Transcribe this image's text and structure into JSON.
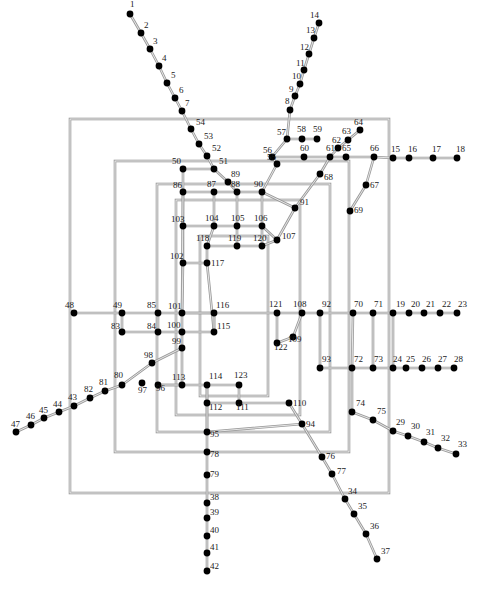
{
  "figure": {
    "type": "graph",
    "width": 478,
    "height": 589,
    "background": "#ffffff",
    "node_color": "#000000",
    "edge_color": "#9a9a9a",
    "label_color": "#1a1a1a",
    "node_count": 123,
    "node_radius": 3.4,
    "edge_width": 2.6
  },
  "nodes": [
    {
      "id": "1",
      "x": 130,
      "y": 14,
      "lx": 130,
      "ly": 7
    },
    {
      "id": "2",
      "x": 141,
      "y": 33,
      "lx": 144,
      "ly": 28
    },
    {
      "id": "3",
      "x": 150,
      "y": 49,
      "lx": 153,
      "ly": 44
    },
    {
      "id": "4",
      "x": 159,
      "y": 66,
      "lx": 162,
      "ly": 61
    },
    {
      "id": "5",
      "x": 167,
      "y": 83,
      "lx": 171,
      "ly": 78
    },
    {
      "id": "6",
      "x": 175,
      "y": 98,
      "lx": 179,
      "ly": 93
    },
    {
      "id": "7",
      "x": 182,
      "y": 111,
      "lx": 185,
      "ly": 106
    },
    {
      "id": "8",
      "x": 290,
      "y": 110,
      "lx": 285,
      "ly": 104
    },
    {
      "id": "9",
      "x": 295,
      "y": 96,
      "lx": 289,
      "ly": 92
    },
    {
      "id": "10",
      "x": 300,
      "y": 84,
      "lx": 292,
      "ly": 79
    },
    {
      "id": "11",
      "x": 304,
      "y": 70,
      "lx": 296,
      "ly": 66
    },
    {
      "id": "12",
      "x": 309,
      "y": 54,
      "lx": 300,
      "ly": 50
    },
    {
      "id": "13",
      "x": 314,
      "y": 38,
      "lx": 306,
      "ly": 33
    },
    {
      "id": "14",
      "x": 319,
      "y": 23,
      "lx": 310,
      "ly": 18
    },
    {
      "id": "15",
      "x": 393,
      "y": 158,
      "lx": 391,
      "ly": 152
    },
    {
      "id": "16",
      "x": 409,
      "y": 158,
      "lx": 408,
      "ly": 152
    },
    {
      "id": "17",
      "x": 433,
      "y": 158,
      "lx": 432,
      "ly": 152
    },
    {
      "id": "18",
      "x": 457,
      "y": 158,
      "lx": 456,
      "ly": 152
    },
    {
      "id": "19",
      "x": 393,
      "y": 313,
      "lx": 396,
      "ly": 307
    },
    {
      "id": "20",
      "x": 409,
      "y": 313,
      "lx": 411,
      "ly": 307
    },
    {
      "id": "21",
      "x": 424,
      "y": 313,
      "lx": 426,
      "ly": 307
    },
    {
      "id": "22",
      "x": 440,
      "y": 313,
      "lx": 442,
      "ly": 307
    },
    {
      "id": "23",
      "x": 457,
      "y": 313,
      "lx": 458,
      "ly": 307
    },
    {
      "id": "24",
      "x": 393,
      "y": 368,
      "lx": 393,
      "ly": 362
    },
    {
      "id": "25",
      "x": 406,
      "y": 368,
      "lx": 406,
      "ly": 362
    },
    {
      "id": "26",
      "x": 422,
      "y": 368,
      "lx": 422,
      "ly": 362
    },
    {
      "id": "27",
      "x": 438,
      "y": 368,
      "lx": 438,
      "ly": 362
    },
    {
      "id": "28",
      "x": 454,
      "y": 368,
      "lx": 454,
      "ly": 362
    },
    {
      "id": "29",
      "x": 393,
      "y": 431,
      "lx": 396,
      "ly": 425
    },
    {
      "id": "30",
      "x": 408,
      "y": 436,
      "lx": 411,
      "ly": 429
    },
    {
      "id": "31",
      "x": 424,
      "y": 442,
      "lx": 426,
      "ly": 435
    },
    {
      "id": "32",
      "x": 438,
      "y": 448,
      "lx": 441,
      "ly": 441
    },
    {
      "id": "33",
      "x": 456,
      "y": 454,
      "lx": 458,
      "ly": 447
    },
    {
      "id": "34",
      "x": 345,
      "y": 499,
      "lx": 348,
      "ly": 494
    },
    {
      "id": "35",
      "x": 354,
      "y": 514,
      "lx": 358,
      "ly": 509
    },
    {
      "id": "36",
      "x": 366,
      "y": 534,
      "lx": 370,
      "ly": 529
    },
    {
      "id": "37",
      "x": 377,
      "y": 559,
      "lx": 381,
      "ly": 554
    },
    {
      "id": "38",
      "x": 207,
      "y": 503,
      "lx": 210,
      "ly": 500
    },
    {
      "id": "39",
      "x": 207,
      "y": 518,
      "lx": 210,
      "ly": 515
    },
    {
      "id": "40",
      "x": 207,
      "y": 536,
      "lx": 210,
      "ly": 533
    },
    {
      "id": "41",
      "x": 207,
      "y": 553,
      "lx": 210,
      "ly": 550
    },
    {
      "id": "42",
      "x": 207,
      "y": 571,
      "lx": 210,
      "ly": 569
    },
    {
      "id": "43",
      "x": 74,
      "y": 406,
      "lx": 68,
      "ly": 400
    },
    {
      "id": "44",
      "x": 59,
      "y": 412,
      "lx": 53,
      "ly": 407
    },
    {
      "id": "45",
      "x": 44,
      "y": 418,
      "lx": 39,
      "ly": 413
    },
    {
      "id": "46",
      "x": 31,
      "y": 425,
      "lx": 26,
      "ly": 419
    },
    {
      "id": "47",
      "x": 16,
      "y": 432,
      "lx": 11,
      "ly": 427
    },
    {
      "id": "48",
      "x": 74,
      "y": 313,
      "lx": 65,
      "ly": 308
    },
    {
      "id": "49",
      "x": 122,
      "y": 313,
      "lx": 113,
      "ly": 308
    },
    {
      "id": "50",
      "x": 183,
      "y": 169,
      "lx": 172,
      "ly": 164
    },
    {
      "id": "51",
      "x": 214,
      "y": 169,
      "lx": 219,
      "ly": 164
    },
    {
      "id": "52",
      "x": 207,
      "y": 156,
      "lx": 212,
      "ly": 151
    },
    {
      "id": "53",
      "x": 199,
      "y": 144,
      "lx": 204,
      "ly": 139
    },
    {
      "id": "54",
      "x": 191,
      "y": 129,
      "lx": 196,
      "ly": 125
    },
    {
      "id": "55",
      "x": 277,
      "y": 164,
      "lx": 267,
      "ly": 160
    },
    {
      "id": "56",
      "x": 272,
      "y": 157,
      "lx": 263,
      "ly": 153
    },
    {
      "id": "57",
      "x": 287,
      "y": 139,
      "lx": 277,
      "ly": 135
    },
    {
      "id": "58",
      "x": 302,
      "y": 139,
      "lx": 297,
      "ly": 132
    },
    {
      "id": "59",
      "x": 317,
      "y": 139,
      "lx": 313,
      "ly": 132
    },
    {
      "id": "60",
      "x": 304,
      "y": 157,
      "lx": 300,
      "ly": 151
    },
    {
      "id": "61",
      "x": 330,
      "y": 157,
      "lx": 326,
      "ly": 151
    },
    {
      "id": "62",
      "x": 338,
      "y": 148,
      "lx": 332,
      "ly": 143
    },
    {
      "id": "63",
      "x": 348,
      "y": 140,
      "lx": 342,
      "ly": 134
    },
    {
      "id": "64",
      "x": 360,
      "y": 130,
      "lx": 354,
      "ly": 125
    },
    {
      "id": "65",
      "x": 346,
      "y": 157,
      "lx": 342,
      "ly": 151
    },
    {
      "id": "66",
      "x": 374,
      "y": 157,
      "lx": 370,
      "ly": 151
    },
    {
      "id": "67",
      "x": 366,
      "y": 185,
      "lx": 370,
      "ly": 188
    },
    {
      "id": "68",
      "x": 320,
      "y": 174,
      "lx": 324,
      "ly": 180
    },
    {
      "id": "69",
      "x": 350,
      "y": 211,
      "lx": 354,
      "ly": 213
    },
    {
      "id": "70",
      "x": 353,
      "y": 313,
      "lx": 354,
      "ly": 307
    },
    {
      "id": "71",
      "x": 373,
      "y": 313,
      "lx": 374,
      "ly": 307
    },
    {
      "id": "72",
      "x": 352,
      "y": 368,
      "lx": 354,
      "ly": 362
    },
    {
      "id": "73",
      "x": 373,
      "y": 368,
      "lx": 374,
      "ly": 362
    },
    {
      "id": "74",
      "x": 352,
      "y": 412,
      "lx": 356,
      "ly": 406
    },
    {
      "id": "75",
      "x": 373,
      "y": 420,
      "lx": 377,
      "ly": 414
    },
    {
      "id": "76",
      "x": 322,
      "y": 457,
      "lx": 326,
      "ly": 459
    },
    {
      "id": "77",
      "x": 332,
      "y": 474,
      "lx": 337,
      "ly": 474
    },
    {
      "id": "78",
      "x": 207,
      "y": 452,
      "lx": 210,
      "ly": 457
    },
    {
      "id": "79",
      "x": 207,
      "y": 475,
      "lx": 210,
      "ly": 477
    },
    {
      "id": "80",
      "x": 122,
      "y": 385,
      "lx": 114,
      "ly": 378
    },
    {
      "id": "81",
      "x": 105,
      "y": 391,
      "lx": 99,
      "ly": 385
    },
    {
      "id": "82",
      "x": 90,
      "y": 398,
      "lx": 84,
      "ly": 392
    },
    {
      "id": "83",
      "x": 122,
      "y": 332,
      "lx": 111,
      "ly": 329
    },
    {
      "id": "84",
      "x": 158,
      "y": 332,
      "lx": 147,
      "ly": 329
    },
    {
      "id": "85",
      "x": 158,
      "y": 313,
      "lx": 147,
      "ly": 308
    },
    {
      "id": "86",
      "x": 183,
      "y": 192,
      "lx": 173,
      "ly": 188
    },
    {
      "id": "87",
      "x": 214,
      "y": 192,
      "lx": 207,
      "ly": 187
    },
    {
      "id": "88",
      "x": 237,
      "y": 192,
      "lx": 231,
      "ly": 187
    },
    {
      "id": "89",
      "x": 228,
      "y": 182,
      "lx": 231,
      "ly": 177
    },
    {
      "id": "90",
      "x": 262,
      "y": 192,
      "lx": 254,
      "ly": 187
    },
    {
      "id": "91",
      "x": 295,
      "y": 208,
      "lx": 300,
      "ly": 205
    },
    {
      "id": "92",
      "x": 320,
      "y": 313,
      "lx": 322,
      "ly": 307
    },
    {
      "id": "93",
      "x": 320,
      "y": 368,
      "lx": 322,
      "ly": 362
    },
    {
      "id": "94",
      "x": 302,
      "y": 424,
      "lx": 306,
      "ly": 427
    },
    {
      "id": "95",
      "x": 207,
      "y": 432,
      "lx": 210,
      "ly": 437
    },
    {
      "id": "96",
      "x": 158,
      "y": 385,
      "lx": 156,
      "ly": 391
    },
    {
      "id": "97",
      "x": 142,
      "y": 383,
      "lx": 138,
      "ly": 393
    },
    {
      "id": "98",
      "x": 152,
      "y": 363,
      "lx": 144,
      "ly": 358
    },
    {
      "id": "99",
      "x": 182,
      "y": 348,
      "lx": 172,
      "ly": 344
    },
    {
      "id": "100",
      "x": 182,
      "y": 332,
      "lx": 167,
      "ly": 328
    },
    {
      "id": "101",
      "x": 182,
      "y": 313,
      "lx": 168,
      "ly": 309
    },
    {
      "id": "102",
      "x": 183,
      "y": 263,
      "lx": 170,
      "ly": 259
    },
    {
      "id": "103",
      "x": 183,
      "y": 226,
      "lx": 171,
      "ly": 222
    },
    {
      "id": "104",
      "x": 214,
      "y": 226,
      "lx": 205,
      "ly": 221
    },
    {
      "id": "105",
      "x": 237,
      "y": 226,
      "lx": 231,
      "ly": 221
    },
    {
      "id": "106",
      "x": 262,
      "y": 226,
      "lx": 254,
      "ly": 221
    },
    {
      "id": "107",
      "x": 277,
      "y": 240,
      "lx": 282,
      "ly": 239
    },
    {
      "id": "108",
      "x": 302,
      "y": 313,
      "lx": 293,
      "ly": 307
    },
    {
      "id": "109",
      "x": 293,
      "y": 337,
      "lx": 288,
      "ly": 342
    },
    {
      "id": "110",
      "x": 289,
      "y": 403,
      "lx": 293,
      "ly": 406
    },
    {
      "id": "111",
      "x": 239,
      "y": 403,
      "lx": 236,
      "ly": 410
    },
    {
      "id": "112",
      "x": 207,
      "y": 403,
      "lx": 209,
      "ly": 410
    },
    {
      "id": "113",
      "x": 182,
      "y": 385,
      "lx": 172,
      "ly": 380
    },
    {
      "id": "114",
      "x": 207,
      "y": 385,
      "lx": 209,
      "ly": 379
    },
    {
      "id": "115",
      "x": 214,
      "y": 332,
      "lx": 217,
      "ly": 329
    },
    {
      "id": "116",
      "x": 214,
      "y": 313,
      "lx": 216,
      "ly": 308
    },
    {
      "id": "117",
      "x": 207,
      "y": 263,
      "lx": 211,
      "ly": 266
    },
    {
      "id": "118",
      "x": 207,
      "y": 246,
      "lx": 196,
      "ly": 241
    },
    {
      "id": "119",
      "x": 237,
      "y": 246,
      "lx": 228,
      "ly": 241
    },
    {
      "id": "120",
      "x": 262,
      "y": 246,
      "lx": 253,
      "ly": 241
    },
    {
      "id": "121",
      "x": 277,
      "y": 313,
      "lx": 269,
      "ly": 307
    },
    {
      "id": "122",
      "x": 277,
      "y": 343,
      "lx": 274,
      "ly": 350
    },
    {
      "id": "123",
      "x": 239,
      "y": 385,
      "lx": 234,
      "ly": 378
    }
  ],
  "edges": [
    [
      "1",
      "2"
    ],
    [
      "2",
      "3"
    ],
    [
      "3",
      "4"
    ],
    [
      "4",
      "5"
    ],
    [
      "5",
      "6"
    ],
    [
      "6",
      "7"
    ],
    [
      "7",
      "54"
    ],
    [
      "54",
      "53"
    ],
    [
      "53",
      "52"
    ],
    [
      "52",
      "51"
    ],
    [
      "51",
      "89"
    ],
    [
      "89",
      "88"
    ],
    [
      "14",
      "13"
    ],
    [
      "13",
      "12"
    ],
    [
      "12",
      "11"
    ],
    [
      "11",
      "10"
    ],
    [
      "10",
      "9"
    ],
    [
      "9",
      "8"
    ],
    [
      "8",
      "57"
    ],
    [
      "57",
      "56"
    ],
    [
      "56",
      "55"
    ],
    [
      "55",
      "90"
    ],
    [
      "90",
      "106"
    ],
    [
      "106",
      "107"
    ],
    [
      "57",
      "58"
    ],
    [
      "58",
      "59"
    ],
    [
      "56",
      "60"
    ],
    [
      "60",
      "61"
    ],
    [
      "61",
      "65"
    ],
    [
      "65",
      "66"
    ],
    [
      "66",
      "15"
    ],
    [
      "15",
      "16"
    ],
    [
      "16",
      "17"
    ],
    [
      "17",
      "18"
    ],
    [
      "61",
      "62"
    ],
    [
      "62",
      "63"
    ],
    [
      "63",
      "64"
    ],
    [
      "66",
      "67"
    ],
    [
      "67",
      "69"
    ],
    [
      "61",
      "68"
    ],
    [
      "68",
      "91"
    ],
    [
      "91",
      "107"
    ],
    [
      "90",
      "91"
    ],
    [
      "50",
      "51"
    ],
    [
      "50",
      "86"
    ],
    [
      "86",
      "87"
    ],
    [
      "87",
      "88"
    ],
    [
      "88",
      "90"
    ],
    [
      "86",
      "103"
    ],
    [
      "103",
      "104"
    ],
    [
      "104",
      "105"
    ],
    [
      "105",
      "106"
    ],
    [
      "87",
      "104"
    ],
    [
      "88",
      "105"
    ],
    [
      "103",
      "102"
    ],
    [
      "102",
      "117"
    ],
    [
      "117",
      "118"
    ],
    [
      "118",
      "119"
    ],
    [
      "119",
      "120"
    ],
    [
      "104",
      "118"
    ],
    [
      "105",
      "119"
    ],
    [
      "106",
      "120"
    ],
    [
      "120",
      "107"
    ],
    [
      "86",
      "101"
    ],
    [
      "101",
      "116"
    ],
    [
      "116",
      "115"
    ],
    [
      "115",
      "100"
    ],
    [
      "100",
      "101"
    ],
    [
      "102",
      "101"
    ],
    [
      "117",
      "115"
    ],
    [
      "48",
      "49"
    ],
    [
      "49",
      "85"
    ],
    [
      "85",
      "101"
    ],
    [
      "101",
      "116"
    ],
    [
      "116",
      "121"
    ],
    [
      "121",
      "108"
    ],
    [
      "108",
      "92"
    ],
    [
      "92",
      "70"
    ],
    [
      "70",
      "71"
    ],
    [
      "71",
      "19"
    ],
    [
      "19",
      "20"
    ],
    [
      "20",
      "21"
    ],
    [
      "21",
      "22"
    ],
    [
      "22",
      "23"
    ],
    [
      "83",
      "84"
    ],
    [
      "84",
      "100"
    ],
    [
      "49",
      "83"
    ],
    [
      "85",
      "84"
    ],
    [
      "121",
      "122"
    ],
    [
      "122",
      "109"
    ],
    [
      "109",
      "108"
    ],
    [
      "92",
      "93"
    ],
    [
      "93",
      "72"
    ],
    [
      "72",
      "73"
    ],
    [
      "73",
      "24"
    ],
    [
      "24",
      "25"
    ],
    [
      "25",
      "26"
    ],
    [
      "26",
      "27"
    ],
    [
      "27",
      "28"
    ],
    [
      "70",
      "72"
    ],
    [
      "71",
      "73"
    ],
    [
      "19",
      "24"
    ],
    [
      "72",
      "74"
    ],
    [
      "74",
      "75"
    ],
    [
      "75",
      "29"
    ],
    [
      "29",
      "30"
    ],
    [
      "30",
      "31"
    ],
    [
      "31",
      "32"
    ],
    [
      "32",
      "33"
    ],
    [
      "99",
      "100"
    ],
    [
      "99",
      "98"
    ],
    [
      "98",
      "80"
    ],
    [
      "80",
      "81"
    ],
    [
      "81",
      "82"
    ],
    [
      "82",
      "43"
    ],
    [
      "43",
      "44"
    ],
    [
      "44",
      "45"
    ],
    [
      "45",
      "46"
    ],
    [
      "46",
      "47"
    ],
    [
      "96",
      "113"
    ],
    [
      "113",
      "114"
    ],
    [
      "114",
      "123"
    ],
    [
      "113",
      "96"
    ],
    [
      "114",
      "112"
    ],
    [
      "112",
      "111"
    ],
    [
      "111",
      "110"
    ],
    [
      "123",
      "111"
    ],
    [
      "110",
      "94"
    ],
    [
      "94",
      "76"
    ],
    [
      "76",
      "77"
    ],
    [
      "77",
      "34"
    ],
    [
      "34",
      "35"
    ],
    [
      "35",
      "36"
    ],
    [
      "36",
      "37"
    ],
    [
      "112",
      "95"
    ],
    [
      "95",
      "78"
    ],
    [
      "78",
      "79"
    ],
    [
      "79",
      "38"
    ],
    [
      "38",
      "39"
    ],
    [
      "39",
      "40"
    ],
    [
      "40",
      "41"
    ],
    [
      "41",
      "42"
    ],
    [
      "95",
      "94"
    ],
    [
      "115",
      "116"
    ],
    [
      "99",
      "113"
    ],
    [
      "114",
      "95"
    ]
  ],
  "rings": [
    {
      "name": "ring-outer",
      "x1": 70,
      "y1": 119,
      "x2": 389,
      "y2": 493
    },
    {
      "name": "ring-second",
      "x1": 115,
      "y1": 161,
      "x2": 349,
      "y2": 452
    },
    {
      "name": "ring-third",
      "x1": 157,
      "y1": 184,
      "x2": 330,
      "y2": 432
    },
    {
      "name": "ring-fourth",
      "x1": 176,
      "y1": 200,
      "x2": 300,
      "y2": 415
    },
    {
      "name": "ring-inner",
      "x1": 200,
      "y1": 236,
      "x2": 268,
      "y2": 396
    }
  ]
}
